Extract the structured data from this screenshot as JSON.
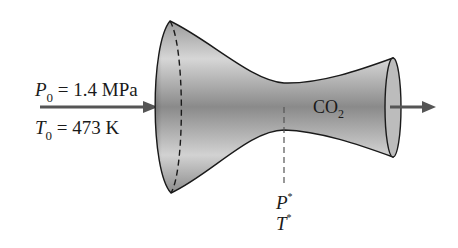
{
  "diagram": {
    "inlet": {
      "pressure": {
        "symbol": "P",
        "subscript": "0",
        "rest": " = 1.4 MPa"
      },
      "temperature": {
        "symbol": "T",
        "subscript": "0",
        "rest": " = 473 K"
      }
    },
    "gas": {
      "text": "CO",
      "subscript": "2"
    },
    "throat": {
      "pressure": {
        "symbol": "P",
        "superscript": "*"
      },
      "temperature": {
        "symbol": "T",
        "superscript": "*"
      }
    },
    "colors": {
      "outline": "#1a1a1a",
      "arrow": "#555555",
      "body_light": "#d8d8d8",
      "body_dark": "#7a7a7a"
    }
  }
}
